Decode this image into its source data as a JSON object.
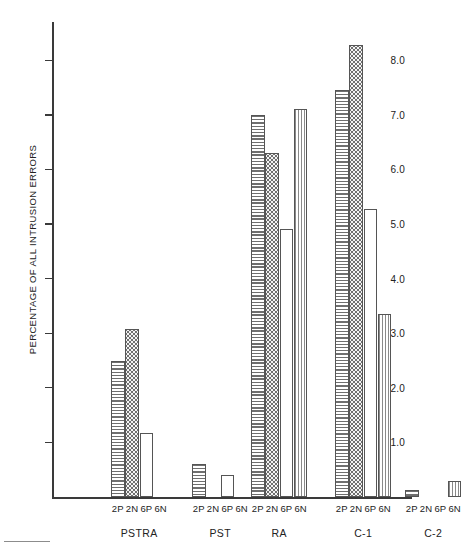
{
  "figure": {
    "ylabel": "PERCENTAGE OF ALL INTRUSION ERRORS"
  },
  "chart_data": {
    "type": "bar",
    "title": "",
    "xlabel": "",
    "ylabel": "PERCENTAGE OF ALL INTRUSION ERRORS",
    "ylim": [
      0,
      8.7
    ],
    "yticks": [
      1.0,
      2.0,
      3.0,
      4.0,
      5.0,
      6.0,
      7.0,
      8.0
    ],
    "ytick_labels": [
      "1.0",
      "2.0",
      "3.0",
      "4.0",
      "5.0",
      "6.0",
      "7.0",
      "8.0"
    ],
    "grid": false,
    "legend": "none",
    "conditions": [
      "2P",
      "2N",
      "6P",
      "6N"
    ],
    "condition_fills": [
      "hlines",
      "dots",
      "open",
      "vlines"
    ],
    "groups": [
      {
        "name": "PSTRA",
        "categories": [
          "2P",
          "2N",
          "6P",
          "6N"
        ],
        "values": [
          2.5,
          3.07,
          1.17,
          0.0
        ]
      },
      {
        "name": "PST",
        "categories": [
          "2P",
          "2N",
          "6P",
          "6N"
        ],
        "values": [
          0.6,
          0.0,
          0.4,
          0.0
        ]
      },
      {
        "name": "RA",
        "categories": [
          "2P",
          "2N",
          "6P",
          "6N"
        ],
        "values": [
          7.0,
          6.3,
          4.9,
          7.1
        ]
      },
      {
        "name": "C-1",
        "categories": [
          "2P",
          "2N",
          "6P",
          "6N"
        ],
        "values": [
          7.45,
          8.27,
          5.27,
          3.35
        ]
      },
      {
        "name": "C-2",
        "categories": [
          "2P",
          "2N",
          "6P",
          "6N"
        ],
        "values": [
          0.13,
          0.0,
          0.0,
          0.3
        ]
      }
    ]
  }
}
